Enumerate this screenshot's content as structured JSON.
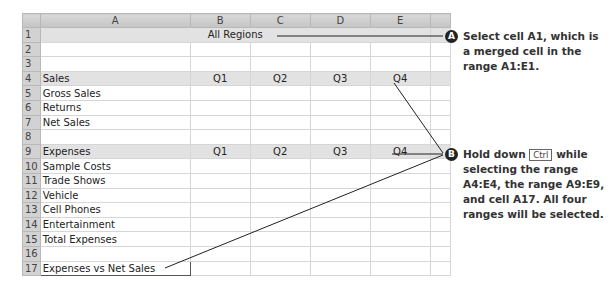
{
  "spreadsheet": {
    "columns": [
      "A",
      "B",
      "C",
      "D",
      "E",
      ""
    ],
    "rows": [
      {
        "num": "1",
        "cells": [
          "",
          "",
          "",
          "",
          "",
          ""
        ],
        "merged_label": "All Regions",
        "selected": true
      },
      {
        "num": "2",
        "cells": [
          "",
          "",
          "",
          "",
          "",
          ""
        ]
      },
      {
        "num": "3",
        "cells": [
          "",
          "",
          "",
          "",
          "",
          ""
        ]
      },
      {
        "num": "4",
        "cells": [
          "Sales",
          "Q1",
          "Q2",
          "Q3",
          "Q4",
          ""
        ],
        "selected": true
      },
      {
        "num": "5",
        "cells": [
          "Gross Sales",
          "",
          "",
          "",
          "",
          ""
        ]
      },
      {
        "num": "6",
        "cells": [
          "Returns",
          "",
          "",
          "",
          "",
          ""
        ]
      },
      {
        "num": "7",
        "cells": [
          "Net Sales",
          "",
          "",
          "",
          "",
          ""
        ]
      },
      {
        "num": "8",
        "cells": [
          "",
          "",
          "",
          "",
          "",
          ""
        ]
      },
      {
        "num": "9",
        "cells": [
          "Expenses",
          "Q1",
          "Q2",
          "Q3",
          "Q4",
          ""
        ],
        "selected": true
      },
      {
        "num": "10",
        "cells": [
          "Sample Costs",
          "",
          "",
          "",
          "",
          ""
        ]
      },
      {
        "num": "11",
        "cells": [
          "Trade Shows",
          "",
          "",
          "",
          "",
          ""
        ]
      },
      {
        "num": "12",
        "cells": [
          "Vehicle",
          "",
          "",
          "",
          "",
          ""
        ]
      },
      {
        "num": "13",
        "cells": [
          "Cell Phones",
          "",
          "",
          "",
          "",
          ""
        ]
      },
      {
        "num": "14",
        "cells": [
          "Entertainment",
          "",
          "",
          "",
          "",
          ""
        ]
      },
      {
        "num": "15",
        "cells": [
          "Total Expenses",
          "",
          "",
          "",
          "",
          ""
        ]
      },
      {
        "num": "16",
        "cells": [
          "",
          "",
          "",
          "",
          "",
          ""
        ]
      },
      {
        "num": "17",
        "cells": [
          "Expenses vs Net Sales",
          "",
          "",
          "",
          "",
          ""
        ],
        "active": true
      }
    ]
  },
  "callouts": {
    "a": {
      "badge": "A",
      "text": "Select cell A1, which is a merged cell in the range A1:E1."
    },
    "b": {
      "badge": "B",
      "text_before": "Hold down",
      "key": "Ctrl",
      "text_after": "while selecting the range A4:E4, the range A9:E9, and cell A17. All four ranges will be selected."
    }
  }
}
